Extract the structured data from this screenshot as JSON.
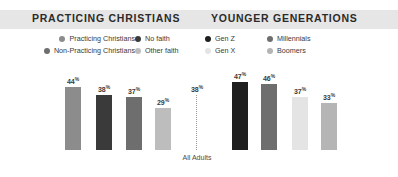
{
  "panels": {
    "left_title": "PRACTICING CHRISTIANS",
    "right_title": "YOUNGER GENERATIONS"
  },
  "legend_left": [
    {
      "label": "Practicing Christians",
      "color": "#8c8c8c"
    },
    {
      "label": "No faith",
      "color": "#3a3a3a"
    },
    {
      "label": "Non-Practicing Christians",
      "color": "#6e6e6e"
    },
    {
      "label": "Other faith",
      "color": "#bdbdbd"
    }
  ],
  "legend_right": [
    {
      "label": "Gen Z",
      "color": "#1f1f1f"
    },
    {
      "label": "Millennials",
      "color": "#6e6e6e"
    },
    {
      "label": "Gen X",
      "color": "#e4e4e4"
    },
    {
      "label": "Boomers",
      "color": "#b5b5b5"
    }
  ],
  "reference": {
    "label": "All Adults",
    "value": 38,
    "value_text": "38",
    "suffix": "%"
  },
  "chart_data": {
    "type": "bar",
    "title": "",
    "subtitle": "",
    "xlabel": "",
    "ylabel": "",
    "ylim": [
      0,
      50
    ],
    "grid": false,
    "legend_position": "top",
    "units": "percent",
    "reference_line": {
      "label": "All Adults",
      "value": 38,
      "style": "dotted"
    },
    "groups": [
      {
        "name": "PRACTICING CHRISTIANS",
        "categories": [
          "Practicing Christians",
          "Non-Practicing Christians",
          "No faith",
          "Other faith"
        ],
        "values": [
          44,
          38,
          37,
          29
        ],
        "colors": [
          "#8c8c8c",
          "#3a3a3a",
          "#6e6e6e",
          "#bdbdbd"
        ]
      },
      {
        "name": "YOUNGER GENERATIONS",
        "categories": [
          "Gen Z",
          "Millennials",
          "Gen X",
          "Boomers"
        ],
        "values": [
          47,
          46,
          37,
          33
        ],
        "colors": [
          "#1f1f1f",
          "#6e6e6e",
          "#e4e4e4",
          "#b5b5b5"
        ]
      }
    ]
  },
  "bars_left": [
    {
      "label": "Practicing Christians",
      "value": 44,
      "value_text": "44",
      "suffix": "%",
      "color": "#8c8c8c",
      "x": 65,
      "height": 63
    },
    {
      "label": "Non-Practicing Christians",
      "value": 38,
      "value_text": "38",
      "suffix": "%",
      "color": "#3a3a3a",
      "x": 96,
      "height": 55
    },
    {
      "label": "No faith",
      "value": 37,
      "value_text": "37",
      "suffix": "%",
      "color": "#6e6e6e",
      "x": 126,
      "height": 53
    },
    {
      "label": "Other faith",
      "value": 29,
      "value_text": "29",
      "suffix": "%",
      "color": "#bdbdbd",
      "x": 155,
      "height": 42
    }
  ],
  "bars_right": [
    {
      "label": "Gen Z",
      "value": 47,
      "value_text": "47",
      "suffix": "%",
      "color": "#1f1f1f",
      "x": 232,
      "height": 68
    },
    {
      "label": "Millennials",
      "value": 46,
      "value_text": "46",
      "suffix": "%",
      "color": "#6e6e6e",
      "x": 261,
      "height": 66
    },
    {
      "label": "Gen X",
      "value": 37,
      "value_text": "37",
      "suffix": "%",
      "color": "#e4e4e4",
      "x": 292,
      "height": 53
    },
    {
      "label": "Boomers",
      "value": 33,
      "value_text": "33",
      "suffix": "%",
      "color": "#b5b5b5",
      "x": 321,
      "height": 47
    }
  ],
  "reference_bar": {
    "x": 189,
    "height": 55
  }
}
